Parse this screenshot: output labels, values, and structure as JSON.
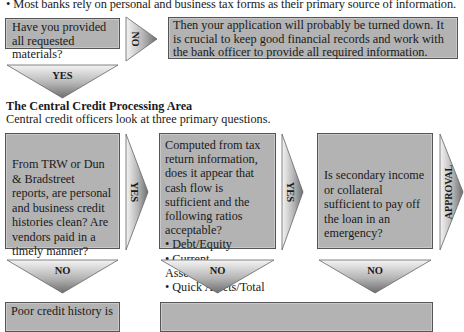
{
  "intro": {
    "bullet": "• Most banks rely on personal and business tax forms as their primary source of information."
  },
  "step1": {
    "question": "Have you provided all requested materials?",
    "no_label": "NO",
    "no_result": "Then your application will probably be turned down. It is crucial to keep good financial records and work with the bank officer to provide all required information.",
    "yes_label": "YES"
  },
  "central": {
    "heading": "The Central Credit Processing Area",
    "subtitle": "Central credit officers look at three primary questions."
  },
  "questions": [
    {
      "text": "From TRW or Dun & Bradstreet reports, are personal and business credit histories clean? Are vendors paid in a timely manner?",
      "yes_label": "YES",
      "no_label": "NO"
    },
    {
      "text": "Computed from tax return information, does it appear that cash flow is sufficient and the following ratios acceptable?",
      "ratios": [
        "Debt/Equity",
        "Current Assets/Sales",
        "Quick Assets/Total"
      ],
      "yes_label": "YES",
      "no_label": "NO"
    },
    {
      "text": "Is secondary income or collateral sufficient to pay off the loan in an emergency?",
      "yes_label": "APPROVAL",
      "no_label": "NO"
    }
  ],
  "outcomes": {
    "poor_credit": "Poor credit history is",
    "combined": ""
  },
  "colors": {
    "box_fill": "#b3b3b3",
    "box_border": "#555555",
    "arrow_light": "#f2f2f2",
    "arrow_dark": "#7a7a7a",
    "text": "#1a1a1a"
  }
}
